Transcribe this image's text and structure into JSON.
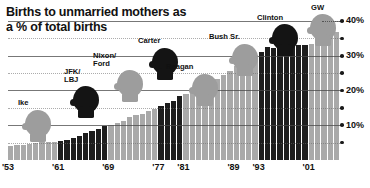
{
  "title": "Births to unmarried mothers\nas a % of total births",
  "chart_data": {
    "type": "bar",
    "title": "Births to unmarried mothers as a % of total births",
    "xlabel": "",
    "ylabel": "% of total births",
    "ylim": [
      0,
      42
    ],
    "xlim": [
      1953,
      2005
    ],
    "grid": true,
    "legend_position": "none",
    "note": "Bar color encodes party of sitting president: dark = Democrat, light gray = Republican",
    "colors": {
      "democrat": "#1d1d1d",
      "republican": "#a9a9a9",
      "text": "#111111",
      "background": "#ffffff"
    },
    "y_ticks": [
      {
        "value": 40,
        "label": "40%"
      },
      {
        "value": 35,
        "label": ""
      },
      {
        "value": 30,
        "label": "30%"
      },
      {
        "value": 25,
        "label": ""
      },
      {
        "value": 20,
        "label": "20%"
      },
      {
        "value": 15,
        "label": ""
      },
      {
        "value": 10,
        "label": "10%"
      },
      {
        "value": 5,
        "label": ""
      }
    ],
    "x_tick_labels": [
      "'53",
      "'61",
      "'69",
      "'77",
      "'81",
      "'89",
      "'93",
      "'01"
    ],
    "x_tick_years": [
      1953,
      1961,
      1969,
      1977,
      1981,
      1989,
      1993,
      2001
    ],
    "categories": [
      1953,
      1954,
      1955,
      1956,
      1957,
      1958,
      1959,
      1960,
      1961,
      1962,
      1963,
      1964,
      1965,
      1966,
      1967,
      1968,
      1969,
      1970,
      1971,
      1972,
      1973,
      1974,
      1975,
      1976,
      1977,
      1978,
      1979,
      1980,
      1981,
      1982,
      1983,
      1984,
      1985,
      1986,
      1987,
      1988,
      1989,
      1990,
      1991,
      1992,
      1993,
      1994,
      1995,
      1996,
      1997,
      1998,
      1999,
      2000,
      2001,
      2002,
      2003,
      2004,
      2005
    ],
    "values": [
      4.0,
      4.2,
      4.4,
      4.6,
      4.8,
      5.1,
      5.3,
      5.3,
      5.6,
      5.9,
      6.3,
      6.8,
      7.7,
      8.4,
      9.0,
      9.7,
      10.0,
      10.7,
      11.3,
      12.4,
      13.0,
      13.2,
      14.2,
      14.8,
      15.5,
      16.3,
      17.1,
      18.4,
      18.9,
      19.4,
      20.3,
      21.0,
      22.0,
      23.4,
      24.5,
      25.7,
      27.1,
      28.0,
      29.5,
      30.1,
      31.0,
      32.6,
      32.2,
      32.4,
      32.4,
      32.8,
      33.0,
      33.2,
      33.5,
      34.0,
      34.6,
      35.8,
      36.9
    ],
    "series_party": [
      "rep",
      "rep",
      "rep",
      "rep",
      "rep",
      "rep",
      "rep",
      "rep",
      "dem",
      "dem",
      "dem",
      "dem",
      "dem",
      "dem",
      "dem",
      "dem",
      "rep",
      "rep",
      "rep",
      "rep",
      "rep",
      "rep",
      "rep",
      "rep",
      "dem",
      "dem",
      "dem",
      "dem",
      "rep",
      "rep",
      "rep",
      "rep",
      "rep",
      "rep",
      "rep",
      "rep",
      "rep",
      "rep",
      "rep",
      "rep",
      "dem",
      "dem",
      "dem",
      "dem",
      "dem",
      "dem",
      "dem",
      "dem",
      "rep",
      "rep",
      "rep",
      "rep",
      "rep"
    ],
    "annotations": [
      {
        "label": "Ike",
        "party": "rep",
        "start_year": 1953,
        "end_year": 1961
      },
      {
        "label": "JFK/\nLBJ",
        "party": "dem",
        "start_year": 1961,
        "end_year": 1969
      },
      {
        "label": "Nixon/\nFord",
        "party": "rep",
        "start_year": 1969,
        "end_year": 1977
      },
      {
        "label": "Carter",
        "party": "dem",
        "start_year": 1977,
        "end_year": 1981
      },
      {
        "label": "Reagan",
        "party": "rep",
        "start_year": 1981,
        "end_year": 1989
      },
      {
        "label": "Bush Sr.",
        "party": "rep",
        "start_year": 1989,
        "end_year": 1993
      },
      {
        "label": "Clinton",
        "party": "dem",
        "start_year": 1993,
        "end_year": 2001
      },
      {
        "label": "GW",
        "party": "rep",
        "start_year": 2001,
        "end_year": 2006
      }
    ]
  }
}
